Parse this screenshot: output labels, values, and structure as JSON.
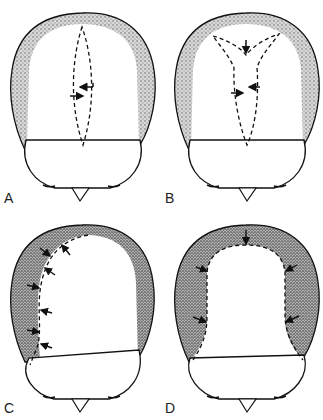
{
  "figure": {
    "panels": [
      {
        "id": "A",
        "label": "A",
        "description": "Top view of head with single fusiform (elliptical) dashed excision at vertex; arrows indicate side-to-side closure"
      },
      {
        "id": "B",
        "label": "B",
        "description": "Y-shaped (tripod) dashed excision at vertex; arrows indicate closure direction"
      },
      {
        "id": "C",
        "label": "C",
        "description": "Unilateral flap outlined by dashed line along one side; arrows indicate advancement"
      },
      {
        "id": "D",
        "label": "D",
        "description": "Bilateral U-shaped dashed excision of bald crown; arrows indicate advancement of hair-bearing scalp"
      }
    ],
    "colors": {
      "outline": "#111111",
      "hair_stipple": "#9a9a9a",
      "background": "#ffffff"
    }
  }
}
